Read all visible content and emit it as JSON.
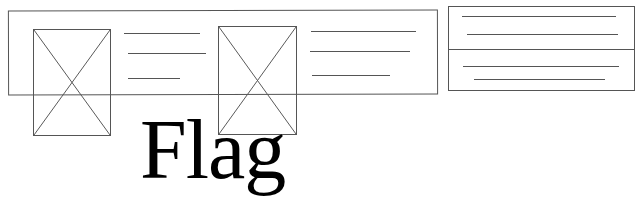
{
  "top_cut_text": "",
  "colors": {
    "stroke": "#555555",
    "text": "#000000",
    "background": "#ffffff"
  },
  "card_strip": {
    "cards": [
      {
        "image_placeholder": "image-placeholder",
        "text_lines": 3
      },
      {
        "image_placeholder": "image-placeholder",
        "text_lines": 3
      }
    ]
  },
  "side_panel": {
    "sections": [
      {
        "text_lines": 2
      },
      {
        "text_lines": 2
      }
    ]
  },
  "flag": {
    "label": "Flag"
  }
}
